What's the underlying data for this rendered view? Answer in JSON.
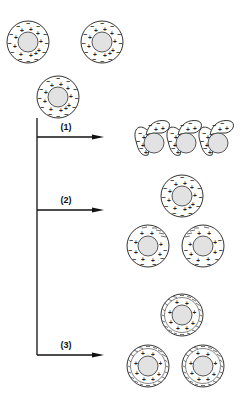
{
  "diagram": {
    "initial_particles": [
      {
        "cx": 28,
        "cy": 42
      },
      {
        "cx": 102,
        "cy": 42
      },
      {
        "cx": 58,
        "cy": 97
      }
    ],
    "particle": {
      "outer_radius": 21,
      "inner_radius": 10
    },
    "branches": [
      {
        "id": "1",
        "label": "(1)",
        "arrow_y": 137,
        "result": "aggregated particles with compressed double layers"
      },
      {
        "id": "2",
        "label": "(2)",
        "arrow_y": 210,
        "result": "particles with partially compressed double layers"
      },
      {
        "id": "3",
        "label": "(3)",
        "arrow_y": 355,
        "result": "particles with strongly compressed (hatched) double layers"
      }
    ],
    "trunk": {
      "x": 37,
      "y_top": 118,
      "y_bottom": 355,
      "arrow_end_x": 104
    },
    "group2_particles": [
      {
        "cx": 182,
        "cy": 196
      },
      {
        "cx": 148,
        "cy": 246
      },
      {
        "cx": 203,
        "cy": 246
      }
    ],
    "group3_particles": [
      {
        "cx": 182,
        "cy": 315
      },
      {
        "cx": 148,
        "cy": 366
      },
      {
        "cx": 203,
        "cy": 366
      }
    ],
    "group1_aggregates": [
      {
        "core_cx": 154,
        "core_cy": 143
      },
      {
        "core_cx": 186,
        "core_cy": 143
      },
      {
        "core_cx": 218,
        "core_cy": 143
      }
    ],
    "colors": {
      "line": "#111111",
      "core_fill": "#e2e2e2",
      "background": "#ffffff"
    }
  }
}
